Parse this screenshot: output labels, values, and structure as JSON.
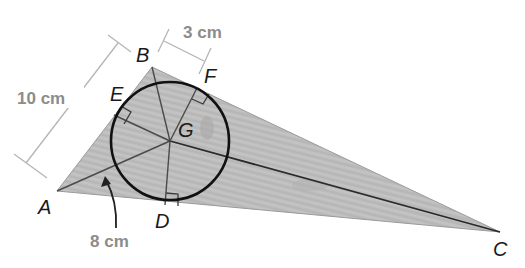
{
  "diagram": {
    "type": "triangle-incircle",
    "vertices": {
      "A": {
        "label": "A",
        "x": 57,
        "y": 191
      },
      "B": {
        "label": "B",
        "x": 152,
        "y": 67
      },
      "C": {
        "label": "C",
        "x": 500,
        "y": 232
      }
    },
    "incenter": {
      "label": "G",
      "x": 170,
      "y": 141,
      "radius": 59
    },
    "tangent_points": {
      "D": {
        "label": "D",
        "x": 165,
        "y": 205
      },
      "E": {
        "label": "E",
        "x": 114,
        "y": 115
      },
      "F": {
        "label": "F",
        "x": 197,
        "y": 88
      }
    },
    "measurements": {
      "AB": "10 cm",
      "BF": "3 cm",
      "AG_arrow": "8 cm"
    },
    "colors": {
      "triangle_fill": "#b9b9b9",
      "triangle_stroke": "#9a9a9a",
      "circle": "#111111",
      "dimension_text": "#8c8c8c",
      "dimension_line": "#b5b5b5",
      "label_text": "#1a1a1a"
    }
  }
}
